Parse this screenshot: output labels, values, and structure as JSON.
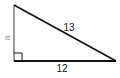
{
  "diagram": {
    "type": "right-triangle",
    "vertices": {
      "top": [
        14,
        5
      ],
      "right_angle": [
        14,
        61
      ],
      "bottom_right": [
        116,
        61
      ]
    },
    "sides": {
      "vertical": {
        "label": "a",
        "color": "#9a9a9a"
      },
      "hypotenuse": {
        "label": "13",
        "color": "#111111"
      },
      "base": {
        "label": "12",
        "color": "#111111"
      }
    },
    "right_angle_marker": {
      "size": 8,
      "color": "#111111"
    }
  }
}
